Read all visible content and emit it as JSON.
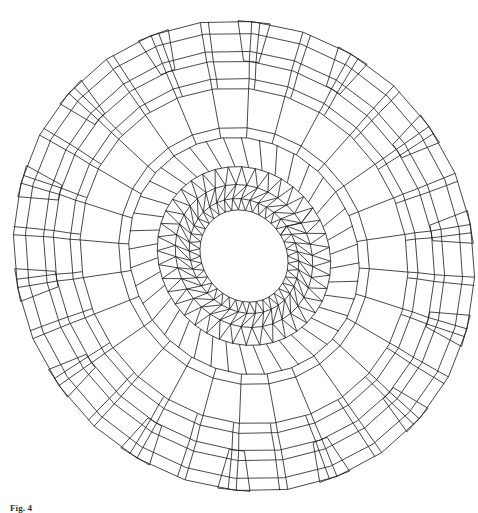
{
  "figure": {
    "stroke_color": "#1a1a1a",
    "background": "#ffffff",
    "center": [
      244,
      256
    ],
    "tilt_deg": -35,
    "outer_rings": [
      {
        "rx": 226,
        "ry": 240
      },
      {
        "rx": 214,
        "ry": 228
      },
      {
        "rx": 196,
        "ry": 210
      },
      {
        "rx": 186,
        "ry": 200
      },
      {
        "rx": 170,
        "ry": 182
      },
      {
        "rx": 160,
        "ry": 172
      },
      {
        "rx": 122,
        "ry": 132
      },
      {
        "rx": 112,
        "ry": 122
      }
    ],
    "inner_rings": [
      {
        "rx": 84,
        "ry": 92
      },
      {
        "rx": 66,
        "ry": 74
      },
      {
        "rx": 52,
        "ry": 60
      },
      {
        "rx": 42,
        "ry": 48
      }
    ],
    "outer_segments": 28,
    "inner_segments": 40
  },
  "caption": {
    "label": "Fig. 4",
    "text": "(caption text cut off at bottom edge of image)"
  }
}
